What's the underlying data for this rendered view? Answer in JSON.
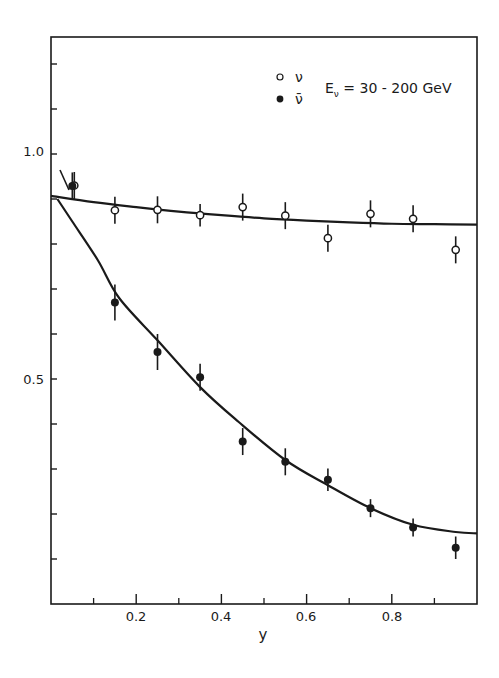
{
  "chart_data": {
    "type": "scatter",
    "title": "",
    "xlabel": "y",
    "ylabel": "",
    "xlim": [
      0,
      1.0
    ],
    "ylim": [
      0,
      1.25
    ],
    "grid": false,
    "legend_position": "upper right",
    "annotation": "E_ν = 30 - 200 GeV",
    "x_ticks": [
      0.2,
      0.4,
      0.6,
      0.8
    ],
    "x_tick_labels": [
      "0.2",
      "0.4",
      "0.6",
      "0.8"
    ],
    "x_minor_ticks": [
      0.1,
      0.3,
      0.5,
      0.7,
      0.9
    ],
    "y_ticks": [
      0.1,
      0.2,
      0.3,
      0.4,
      0.5,
      0.6,
      0.7,
      0.8,
      0.9,
      1.0,
      1.1,
      1.2
    ],
    "y_tick_labels": {
      "0.5": "0.5",
      "1.0": "1.0"
    },
    "series": [
      {
        "name": "ν",
        "marker": "open-circle",
        "x": [
          0.05,
          0.15,
          0.25,
          0.35,
          0.45,
          0.55,
          0.65,
          0.75,
          0.85,
          0.95
        ],
        "values": [
          0.93,
          0.875,
          0.876,
          0.864,
          0.882,
          0.863,
          0.813,
          0.867,
          0.856,
          0.787
        ],
        "errors": [
          0.03,
          0.03,
          0.03,
          0.025,
          0.03,
          0.03,
          0.03,
          0.03,
          0.03,
          0.03
        ]
      },
      {
        "name": "ν̄",
        "marker": "filled-circle",
        "x": [
          0.05,
          0.15,
          0.25,
          0.35,
          0.45,
          0.55,
          0.65,
          0.75,
          0.85,
          0.95
        ],
        "values": [
          0.929,
          0.67,
          0.56,
          0.504,
          0.361,
          0.316,
          0.276,
          0.213,
          0.17,
          0.125
        ],
        "errors": [
          0.03,
          0.04,
          0.04,
          0.03,
          0.03,
          0.03,
          0.025,
          0.02,
          0.02,
          0.025
        ]
      }
    ],
    "fit_curves": [
      {
        "name": "ν fit",
        "x": [
          0.0,
          0.1,
          0.2,
          0.3,
          0.4,
          0.5,
          0.6,
          0.7,
          0.8,
          0.9,
          1.0
        ],
        "values": [
          0.907,
          0.893,
          0.882,
          0.872,
          0.864,
          0.857,
          0.852,
          0.848,
          0.845,
          0.844,
          0.843
        ]
      },
      {
        "name": "ν̄ fit",
        "x": [
          0.015,
          0.05,
          0.11,
          0.16,
          0.25,
          0.35,
          0.44,
          0.55,
          0.65,
          0.75,
          0.85,
          0.95,
          1.0
        ],
        "values": [
          0.9,
          0.85,
          0.764,
          0.68,
          0.586,
          0.482,
          0.405,
          0.32,
          0.264,
          0.213,
          0.176,
          0.16,
          0.157
        ]
      }
    ]
  },
  "legend": {
    "items": [
      {
        "symbol": "open-circle",
        "label": "ν"
      },
      {
        "symbol": "filled-circle",
        "label": "ν̄"
      }
    ],
    "energy_label_main": "E",
    "energy_label_sub": "ν",
    "energy_label_rest": " = 30 - 200 GeV"
  },
  "axes": {
    "x_title": "y",
    "y_label_1": "1.0",
    "y_label_05": "0.5",
    "x_labels": [
      "0.2",
      "0.4",
      "0.6",
      "0.8"
    ]
  },
  "colors": {
    "ink": "#1a1a1a",
    "background": "#ffffff"
  }
}
